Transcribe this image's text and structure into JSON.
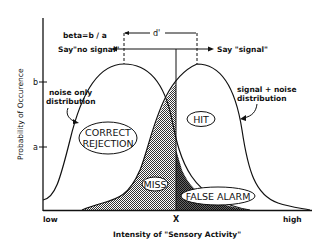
{
  "diagram": {
    "beta_formula": "beta=b / a",
    "d_prime_label": "d'",
    "say_no_signal": "Say\"no signal\"",
    "say_signal": "Say \"signal\"",
    "noise_label_line1": "noise only",
    "noise_label_line2": "distribution",
    "signal_label_line1": "signal + noise",
    "signal_label_line2": "distribution",
    "regions": {
      "correct_rejection_line1": "CORRECT",
      "correct_rejection_line2": "REJECTION",
      "hit": "HIT",
      "miss": "MISS",
      "false_alarm": "FALSE ALARM"
    },
    "y_axis": {
      "label": "Probability of Occurence",
      "ticks": [
        "b",
        "a"
      ]
    },
    "x_axis": {
      "label": "Intensity of \"Sensory Activity\"",
      "low": "low",
      "criterion": "X",
      "high": "high"
    },
    "colors": {
      "line": "#111111",
      "shade": "#555555",
      "background": "#ffffff"
    }
  }
}
